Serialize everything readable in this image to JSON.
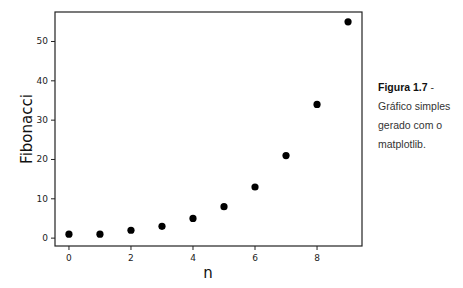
{
  "chart_data": {
    "type": "scatter",
    "title": "",
    "xlabel": "n",
    "ylabel": "Fibonacci",
    "x": [
      0,
      1,
      2,
      3,
      4,
      5,
      6,
      7,
      8,
      9
    ],
    "values": [
      1,
      1,
      2,
      3,
      5,
      8,
      13,
      21,
      34,
      55
    ],
    "series": [
      {
        "name": "Fibonacci",
        "x": [
          0,
          1,
          2,
          3,
          4,
          5,
          6,
          7,
          8,
          9
        ],
        "values": [
          1,
          1,
          2,
          3,
          5,
          8,
          13,
          21,
          34,
          55
        ],
        "color": "#000000",
        "marker": "circle"
      }
    ],
    "xticks": [
      0,
      2,
      4,
      6,
      8
    ],
    "yticks": [
      0,
      10,
      20,
      30,
      40,
      50
    ],
    "xlim": [
      -0.45,
      9.45
    ],
    "ylim": [
      -2,
      57.5
    ],
    "grid": false,
    "legend": null
  },
  "caption": {
    "figure_label": "Figura 1.7",
    "separator": " -",
    "text": "Gráfico simples gerado com o matplotlib."
  }
}
